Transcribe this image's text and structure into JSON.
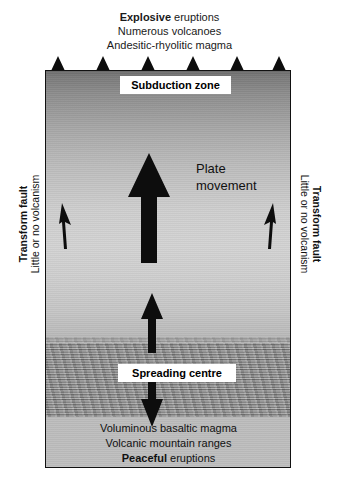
{
  "diagram": {
    "title_caption": {
      "lines": [
        {
          "bold": "Explosive",
          "rest": " eruptions"
        },
        {
          "bold": "",
          "rest": "Numerous volcanoes"
        },
        {
          "bold": "",
          "rest": "Andesitic-rhyolitic magma"
        }
      ]
    },
    "bottom_caption": {
      "lines": [
        {
          "bold": "",
          "rest": "Voluminous basaltic magma"
        },
        {
          "bold": "",
          "rest": "Volcanic mountain ranges"
        },
        {
          "bold": "Peaceful",
          "rest": " eruptions"
        }
      ]
    },
    "labels": {
      "subduction_zone": "Subduction zone",
      "spreading_centre": "Spreading centre",
      "plate_movement_line1": "Plate",
      "plate_movement_line2": "movement"
    },
    "side_labels": {
      "left": {
        "line1": "Transform fault",
        "line2": "Little or no volcanism"
      },
      "right": {
        "line1": "Transform fault",
        "line2": "Little or no volcanism"
      }
    },
    "volcanoes": {
      "count": 6,
      "positions_px": [
        13,
        58,
        103,
        148,
        192,
        234
      ]
    },
    "arrows": {
      "plate_movement": {
        "name": "large-up-arrow",
        "direction": "up"
      },
      "spreading_up": {
        "name": "medium-up-arrow",
        "direction": "up"
      },
      "spreading_down": {
        "name": "medium-down-arrow",
        "direction": "down"
      },
      "left_small": {
        "name": "small-up-arrow-left",
        "direction": "up"
      },
      "right_small": {
        "name": "small-up-arrow-right",
        "direction": "up"
      }
    },
    "colors": {
      "ink": "#111111",
      "arrow_fill": "#0d0d0d",
      "label_background": "#ffffff",
      "box_border": "#111111",
      "mantle_dark": "#6e6e6e",
      "mantle_light": "#d3d3d3",
      "spreading_band": "#8b8b8b"
    }
  }
}
